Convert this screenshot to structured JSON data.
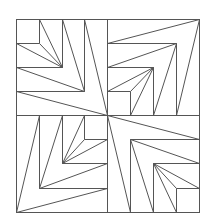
{
  "diagram": {
    "type": "quilt-block-line-drawing",
    "canvas": {
      "width": 214,
      "height": 223,
      "background": "#ffffff"
    },
    "stroke": {
      "color": "#555555",
      "width": 1
    },
    "frame": {
      "x": 16,
      "y": 19,
      "width": 183,
      "height": 193
    },
    "center": [
      107,
      115
    ],
    "quadrants": [
      {
        "name": "top-left",
        "fan_vertex": [
          107,
          115
        ],
        "lines": [
          [
            16,
            43,
            39,
            43
          ],
          [
            39,
            19,
            39,
            43
          ],
          [
            39,
            19,
            62,
            67
          ],
          [
            16,
            43,
            62,
            67
          ],
          [
            39,
            43,
            62,
            67
          ],
          [
            62,
            19,
            62,
            67
          ],
          [
            16,
            67,
            62,
            67
          ],
          [
            62,
            19,
            84,
            91
          ],
          [
            16,
            67,
            84,
            91
          ],
          [
            84,
            19,
            84,
            91
          ],
          [
            16,
            91,
            84,
            91
          ],
          [
            84,
            19,
            107,
            115
          ],
          [
            16,
            91,
            107,
            115
          ]
        ]
      },
      {
        "name": "top-right",
        "fan_vertex": [
          199,
          19
        ],
        "lines": [
          [
            107,
            91,
            130,
            91
          ],
          [
            130,
            91,
            130,
            115
          ],
          [
            130,
            115,
            153,
            67
          ],
          [
            107,
            91,
            153,
            67
          ],
          [
            130,
            91,
            153,
            67
          ],
          [
            153,
            67,
            153,
            115
          ],
          [
            107,
            67,
            153,
            67
          ],
          [
            153,
            115,
            176,
            43
          ],
          [
            107,
            67,
            176,
            43
          ],
          [
            176,
            43,
            176,
            115
          ],
          [
            107,
            43,
            176,
            43
          ],
          [
            176,
            115,
            199,
            19
          ],
          [
            107,
            43,
            199,
            19
          ]
        ]
      },
      {
        "name": "bottom-left",
        "fan_vertex": [
          16,
          212
        ],
        "lines": [
          [
            84,
            115,
            84,
            139
          ],
          [
            84,
            139,
            107,
            139
          ],
          [
            62,
            163,
            84,
            115
          ],
          [
            62,
            163,
            107,
            139
          ],
          [
            62,
            163,
            84,
            139
          ],
          [
            62,
            115,
            62,
            163
          ],
          [
            62,
            163,
            107,
            163
          ],
          [
            39,
            188,
            62,
            115
          ],
          [
            39,
            188,
            107,
            163
          ],
          [
            39,
            115,
            39,
            188
          ],
          [
            39,
            188,
            107,
            188
          ],
          [
            16,
            212,
            39,
            115
          ],
          [
            16,
            212,
            107,
            188
          ]
        ]
      },
      {
        "name": "bottom-right",
        "fan_vertex": [
          107,
          115
        ],
        "lines": [
          [
            107,
            115,
            130,
            212
          ],
          [
            107,
            115,
            199,
            139
          ],
          [
            130,
            139,
            130,
            212
          ],
          [
            130,
            139,
            199,
            139
          ],
          [
            130,
            139,
            153,
            212
          ],
          [
            130,
            139,
            199,
            163
          ],
          [
            153,
            163,
            153,
            212
          ],
          [
            153,
            163,
            199,
            163
          ],
          [
            153,
            163,
            176,
            212
          ],
          [
            153,
            163,
            199,
            188
          ],
          [
            153,
            163,
            176,
            188
          ],
          [
            176,
            188,
            176,
            212
          ],
          [
            176,
            188,
            199,
            188
          ]
        ]
      }
    ],
    "dividers": [
      [
        107,
        19,
        107,
        212
      ],
      [
        16,
        115,
        199,
        115
      ]
    ]
  }
}
